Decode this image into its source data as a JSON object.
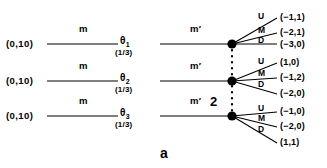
{
  "figure": {
    "caption": "a",
    "player_label": "2",
    "ink_color": "#000000"
  },
  "rows": [
    {
      "initial_payoff": "(0,10)",
      "first_move": "m",
      "type_symbol": "θ",
      "type_index": "1",
      "probability": "(1/3)",
      "second_move": "m′",
      "branches": [
        {
          "label": "U",
          "payoff": "(−1,1)"
        },
        {
          "label": "M",
          "payoff": "(−2,1)"
        },
        {
          "label": "D",
          "payoff": "(−3,0)"
        }
      ]
    },
    {
      "initial_payoff": "(0,10)",
      "first_move": "m",
      "type_symbol": "θ",
      "type_index": "2",
      "probability": "(1/3)",
      "second_move": "m′",
      "branches": [
        {
          "label": "U",
          "payoff": "(1,0)"
        },
        {
          "label": "M",
          "payoff": "(−1,2)"
        },
        {
          "label": "D",
          "payoff": "(−2,0)"
        }
      ]
    },
    {
      "initial_payoff": "(0,10)",
      "first_move": "m",
      "type_symbol": "θ",
      "type_index": "3",
      "probability": "(1/3)",
      "second_move": "m′",
      "branches": [
        {
          "label": "U",
          "payoff": "(−1,0)"
        },
        {
          "label": "M",
          "payoff": "(−2,0)"
        },
        {
          "label": "D",
          "payoff": "(1,1)"
        }
      ]
    }
  ]
}
